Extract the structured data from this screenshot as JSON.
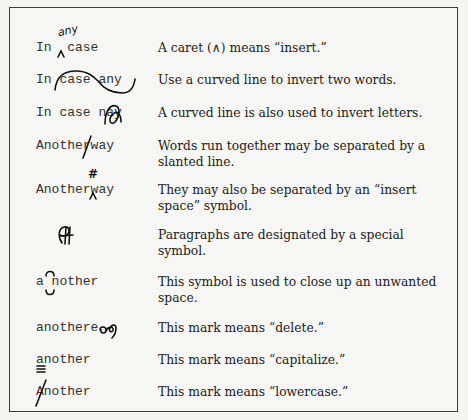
{
  "rows": [
    {
      "example": "In  case",
      "mark": "insert-caret",
      "mark_text": "any",
      "description": "A caret (∧) means “insert.”"
    },
    {
      "example": "In case any",
      "mark": "transpose-words",
      "description": "Use a curved line to invert two words."
    },
    {
      "example": "In case nay",
      "mark": "transpose-letters",
      "description": "A curved line is also used to invert letters."
    },
    {
      "example": "Anotherway",
      "mark": "slash-separate",
      "description": "Words run together may be separated by a slanted line."
    },
    {
      "example": "Anotherway",
      "mark": "insert-space",
      "mark_text": "#",
      "description": "They may also be separated by an “insert space” symbol."
    },
    {
      "example": "",
      "mark": "paragraph",
      "mark_text": "Ɽ",
      "description": "Paragraphs are designated by a special symbol."
    },
    {
      "example": "a nother",
      "mark": "close-up",
      "description": "This symbol is used to close up an unwanted space."
    },
    {
      "example": "anothere",
      "mark": "delete",
      "description": "This mark means “delete.”"
    },
    {
      "example": "another",
      "mark": "capitalize",
      "description": "This mark means “capitalize.”"
    },
    {
      "example": "Another",
      "mark": "lowercase",
      "description": "This mark means “lowercase.”"
    }
  ]
}
